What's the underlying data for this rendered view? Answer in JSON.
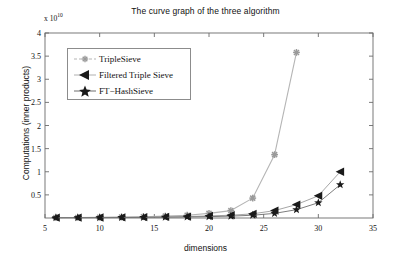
{
  "chart_data": {
    "type": "line",
    "title": "The curve graph of the three algorithm",
    "xlabel": "dimensions",
    "ylabel": "Computations (inner products)",
    "y_exponent_base": "x 10",
    "y_exponent_power": "10",
    "y_axis_multiplier": "x 10^10",
    "xlim": [
      5,
      35
    ],
    "ylim": [
      0,
      4
    ],
    "xticks": [
      5,
      10,
      15,
      20,
      25,
      30,
      35
    ],
    "xtick_labels": [
      "5",
      "10",
      "15",
      "20",
      "25",
      "30",
      "35"
    ],
    "yticks": [
      0.5,
      1,
      1.5,
      2,
      2.5,
      3,
      3.5,
      4
    ],
    "ytick_labels": [
      "0.5",
      "1",
      "1.5",
      "2",
      "2.5",
      "3",
      "3.5",
      "4"
    ],
    "grid": false,
    "legend_position": "upper left",
    "series": [
      {
        "name": "TripleSieve",
        "marker": "asterisk",
        "color": "#9a9a9a",
        "line_color": "#b5b5b5",
        "x": [
          6,
          8,
          10,
          12,
          14,
          16,
          18,
          20,
          22,
          24,
          26,
          28
        ],
        "y": [
          0.01,
          0.012,
          0.015,
          0.02,
          0.028,
          0.04,
          0.06,
          0.1,
          0.16,
          0.43,
          1.37,
          3.58
        ]
      },
      {
        "name": "Filtered Triple Sieve",
        "marker": "left-triangle",
        "color": "#1a1a1a",
        "line_color": "#9c9c9c",
        "x": [
          6,
          8,
          10,
          12,
          14,
          16,
          18,
          20,
          22,
          24,
          26,
          28,
          30,
          32
        ],
        "y": [
          0.008,
          0.009,
          0.011,
          0.014,
          0.018,
          0.024,
          0.032,
          0.045,
          0.06,
          0.09,
          0.16,
          0.29,
          0.48,
          1.0
        ]
      },
      {
        "name": "FT−HashSieve",
        "marker": "star",
        "color": "#1a1a1a",
        "line_color": "#6e6e6e",
        "x": [
          6,
          8,
          10,
          12,
          14,
          16,
          18,
          20,
          22,
          24,
          26,
          28,
          30,
          32
        ],
        "y": [
          0.006,
          0.007,
          0.008,
          0.01,
          0.013,
          0.017,
          0.022,
          0.03,
          0.04,
          0.06,
          0.1,
          0.18,
          0.33,
          0.72
        ]
      }
    ],
    "axis_color": "#6b6b6b",
    "text_color": "#111111"
  },
  "legend": {
    "entries": [
      {
        "label": "TripleSieve"
      },
      {
        "label": "Filtered Triple Sieve"
      },
      {
        "label": "FT−HashSieve"
      }
    ]
  }
}
